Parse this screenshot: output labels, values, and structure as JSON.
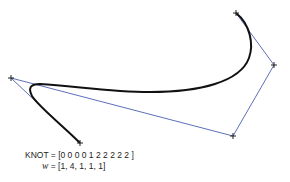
{
  "figure": {
    "knot_label": "KNOT = [0 0 0 0 1 2 2 2 2 2 ]",
    "weights_symbol": "w",
    "weights_values": "= [1, 4, 1, 1, 1]"
  },
  "control_polygon": {
    "color": "#4a5fb0",
    "points": [
      [
        80,
        143
      ],
      [
        11,
        78
      ],
      [
        233,
        136
      ],
      [
        274,
        65
      ],
      [
        236,
        13
      ]
    ]
  },
  "curve": {
    "color": "#111111",
    "type": "rational-b-spline"
  }
}
